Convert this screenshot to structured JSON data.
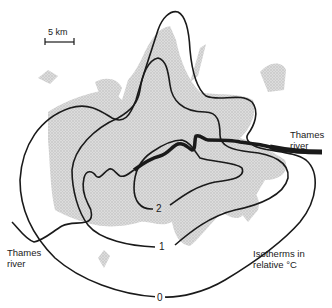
{
  "figure": {
    "type": "isotherm-map"
  },
  "scale_bar": {
    "label": "5 km"
  },
  "labels": {
    "river_east_line1": "Thames",
    "river_east_line2": "river",
    "river_west_line1": "Thames",
    "river_west_line2": "river",
    "legend_line1": "Isotherms in",
    "legend_line2": "relative °C"
  },
  "isotherms": [
    {
      "value": "0",
      "label": "0"
    },
    {
      "value": "1",
      "label": "1"
    },
    {
      "value": "2",
      "label": "2"
    }
  ],
  "colors": {
    "line": "#1a1a1a",
    "built_up_area": "#d4d4d4",
    "background": "#ffffff"
  }
}
